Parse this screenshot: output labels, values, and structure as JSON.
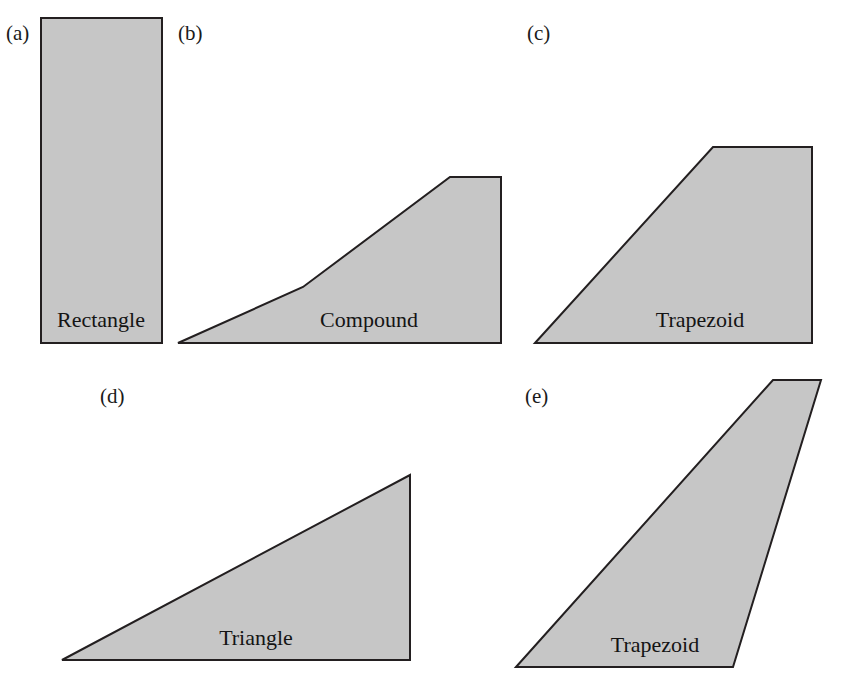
{
  "figure": {
    "width": 843,
    "height": 695,
    "background_color": "#ffffff",
    "fill_color": "#c6c6c6",
    "stroke_color": "#231f20",
    "stroke_width": 2,
    "label_color": "#141414"
  },
  "chart_data": {
    "type": "diagram",
    "subtype": "planform-outline-set",
    "units": "pixels",
    "baselines": {
      "row1_y": 343,
      "row2_y": 660
    },
    "panels": [
      {
        "letter": "(a)",
        "label": "Rectangle",
        "letter_x": 6,
        "letter_y": 40,
        "label_x": 101,
        "label_y": 327,
        "shape": "rectangle",
        "points": "41,18 162,18 162,343 41,343",
        "vertices": [
          [
            41,
            18
          ],
          [
            162,
            18
          ],
          [
            162,
            343
          ],
          [
            41,
            343
          ]
        ],
        "root_chord": 325,
        "tip_chord": 325,
        "span": 121,
        "taper_ratio": 1.0,
        "sweep": "none"
      },
      {
        "letter": "(b)",
        "label": "Compound",
        "letter_x": 178,
        "letter_y": 40,
        "label_x": 369,
        "label_y": 327,
        "shape": "compound",
        "points": "178,343 303,287 450,177 501,177 501,343",
        "vertices": [
          [
            178,
            343
          ],
          [
            303,
            287
          ],
          [
            450,
            177
          ],
          [
            501,
            177
          ],
          [
            501,
            343
          ]
        ],
        "root_chord": 166,
        "tip_chord": 0,
        "span": 323,
        "taper_ratio": 0.0,
        "sweep": "compound-double-taper",
        "breakpoint": [
          303,
          287
        ]
      },
      {
        "letter": "(c)",
        "label": "Trapezoid",
        "letter_x": 527,
        "letter_y": 40,
        "label_x": 700,
        "label_y": 327,
        "shape": "trapezoid",
        "points": "535,343 713,147 812,147 812,343",
        "vertices": [
          [
            535,
            343
          ],
          [
            713,
            147
          ],
          [
            812,
            147
          ],
          [
            812,
            343
          ]
        ],
        "root_chord": 196,
        "tip_chord": 0,
        "span": 277,
        "taper_ratio": 0.0,
        "sweep": "swept-leading-edge"
      },
      {
        "letter": "(d)",
        "label": "Triangle",
        "letter_x": 100,
        "letter_y": 403,
        "label_x": 256,
        "label_y": 645,
        "shape": "triangle",
        "points": "62,660 410,475 410,660",
        "vertices": [
          [
            62,
            660
          ],
          [
            410,
            475
          ],
          [
            410,
            660
          ]
        ],
        "root_chord": 185,
        "tip_chord": 0,
        "span": 348,
        "taper_ratio": 0.0,
        "sweep": "delta"
      },
      {
        "letter": "(e)",
        "label": "Trapezoid",
        "letter_x": 525,
        "letter_y": 403,
        "label_x": 655,
        "label_y": 652,
        "shape": "trapezoid",
        "points": "516,667 773,380 821,380 733,667",
        "vertices": [
          [
            516,
            667
          ],
          [
            773,
            380
          ],
          [
            821,
            380
          ],
          [
            733,
            667
          ]
        ],
        "root_chord": 217,
        "tip_chord": 48,
        "span": 287,
        "taper_ratio": 0.22,
        "sweep": "swept-raked-tip"
      }
    ]
  }
}
